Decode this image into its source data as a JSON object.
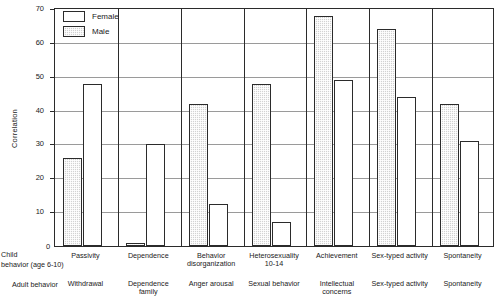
{
  "chart_data": {
    "type": "bar",
    "title": "",
    "xlabel": "",
    "ylabel": "Correlation",
    "ylim": [
      0,
      70
    ],
    "yticks": [
      0,
      10,
      20,
      30,
      40,
      50,
      60,
      70
    ],
    "grid": true,
    "legend_position": "top-left",
    "categories": [
      "Passivity",
      "Dependence",
      "Behavior disorganization",
      "Heterosexuality 10-14",
      "Achievement",
      "Sex-typed activity",
      "Spontaneity"
    ],
    "child_behavior_labels": [
      "Passivity",
      "Dependence",
      "Behavior disorganization",
      "Heterosexuality 10-14",
      "Achievement",
      "Sex-typed activity",
      "Spontaneity"
    ],
    "adult_behavior_labels": [
      "Withdrawal",
      "Dependence family",
      "Anger arousal",
      "Sexual behavior",
      "Intellectual concerns",
      "Sex-typed activity",
      "Spontaneity"
    ],
    "series": [
      {
        "name": "Female",
        "color": "#ffffff",
        "values": [
          48,
          30,
          12.5,
          7,
          49,
          44,
          31
        ]
      },
      {
        "name": "Male",
        "color": "#d2d2d2",
        "values": [
          26,
          1,
          42,
          48,
          68,
          64,
          42
        ]
      }
    ]
  },
  "axis": {
    "y_title": "Correlation",
    "y_tick_labels": [
      "70",
      "60",
      "50",
      "40",
      "30",
      "20",
      "10",
      "0"
    ]
  },
  "legend": {
    "items": [
      {
        "label": "Female",
        "swatch": "white-rect"
      },
      {
        "label": "Male",
        "swatch": "hatched-rect"
      }
    ]
  },
  "row_headers": {
    "child": {
      "line1": "Child",
      "line2": "behavior (age 6-10)"
    },
    "adult": {
      "line1": "Adult behavior"
    }
  },
  "groups": [
    {
      "child_line1": "Passivity",
      "child_line2": "",
      "adult_line1": "Withdrawal",
      "adult_line2": "",
      "male": 26,
      "female": 48
    },
    {
      "child_line1": "Dependence",
      "child_line2": "",
      "adult_line1": "Dependence",
      "adult_line2": "family",
      "male": 1,
      "female": 30
    },
    {
      "child_line1": "Behavior",
      "child_line2": "disorganization",
      "adult_line1": "Anger arousal",
      "adult_line2": "",
      "male": 42,
      "female": 12.5
    },
    {
      "child_line1": "Heterosexuality",
      "child_line2": "10-14",
      "adult_line1": "Sexual behavior",
      "adult_line2": "",
      "male": 48,
      "female": 7
    },
    {
      "child_line1": "Achievement",
      "child_line2": "",
      "adult_line1": "Intellectual",
      "adult_line2": "concerns",
      "male": 68,
      "female": 49
    },
    {
      "child_line1": "Sex-typed activity",
      "child_line2": "",
      "adult_line1": "Sex-typed activity",
      "adult_line2": "",
      "male": 64,
      "female": 44
    },
    {
      "child_line1": "Spontaneity",
      "child_line2": "",
      "adult_line1": "Spontaneity",
      "adult_line2": "",
      "male": 42,
      "female": 31
    }
  ],
  "colors": {
    "axis": "#2b2b2b",
    "grid": "#9a9a9a",
    "male_fill": "#d2d2d2",
    "female_fill": "#ffffff",
    "background": "#ffffff"
  }
}
